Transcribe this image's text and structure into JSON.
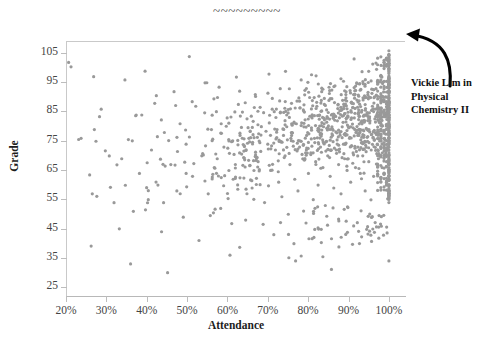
{
  "chart_data": {
    "type": "scatter",
    "title": "~~~~~~~~~",
    "xlabel": "Attendance",
    "ylabel": "Grade",
    "xlim": [
      20,
      104
    ],
    "ylim": [
      22,
      109
    ],
    "grid": false,
    "legend": null,
    "marker_color": "#999999",
    "marker_size_px": 3.2,
    "xticks": [
      20,
      30,
      40,
      50,
      60,
      70,
      80,
      90,
      100
    ],
    "xtick_labels": [
      "20%",
      "30%",
      "40%",
      "50%",
      "60%",
      "70%",
      "80%",
      "90%",
      "100%"
    ],
    "yticks": [
      25,
      35,
      45,
      55,
      65,
      75,
      85,
      95,
      105
    ],
    "ytick_labels": [
      "25",
      "35",
      "45",
      "55",
      "65",
      "75",
      "85",
      "95",
      "105"
    ],
    "annotations": [
      {
        "name": "vickie-lim-callout",
        "lines": [
          "Vickie Lim in",
          "Physical",
          "Chemistry II"
        ],
        "points_to": [
          100,
          106
        ]
      }
    ],
    "points": [
      [
        20.4,
        102
      ],
      [
        21.0,
        100.5
      ],
      [
        23.5,
        76
      ],
      [
        26.8,
        79
      ],
      [
        27.2,
        75
      ],
      [
        28.5,
        86
      ],
      [
        33.0,
        45
      ],
      [
        33.6,
        69
      ],
      [
        34.4,
        96
      ],
      [
        35.8,
        33
      ],
      [
        36.5,
        51
      ],
      [
        37.2,
        84
      ],
      [
        38.0,
        64
      ],
      [
        39.4,
        99
      ],
      [
        40.2,
        55
      ],
      [
        41.0,
        72
      ],
      [
        41.8,
        88
      ],
      [
        42.6,
        60
      ],
      [
        43.5,
        44
      ],
      [
        44.2,
        78
      ],
      [
        45.0,
        30
      ],
      [
        45.8,
        67
      ],
      [
        46.6,
        92
      ],
      [
        47.3,
        58
      ],
      [
        48.1,
        81
      ],
      [
        48.9,
        49
      ],
      [
        49.6,
        74
      ],
      [
        50.4,
        104
      ],
      [
        51.2,
        63
      ],
      [
        52.0,
        87
      ],
      [
        52.8,
        41
      ],
      [
        53.5,
        70
      ],
      [
        54.3,
        95
      ],
      [
        55.1,
        57
      ],
      [
        55.9,
        79
      ],
      [
        56.6,
        66
      ],
      [
        57.4,
        90
      ],
      [
        58.2,
        52
      ],
      [
        59.0,
        73
      ],
      [
        59.8,
        83
      ],
      [
        60.5,
        36
      ],
      [
        61.3,
        62
      ],
      [
        62.1,
        97
      ],
      [
        62.9,
        71
      ],
      [
        63.6,
        85
      ],
      [
        64.4,
        48
      ],
      [
        65.2,
        76
      ],
      [
        66.0,
        59
      ],
      [
        66.8,
        91
      ],
      [
        67.5,
        68
      ],
      [
        68.3,
        80
      ],
      [
        69.1,
        54
      ],
      [
        69.9,
        74
      ],
      [
        70.2,
        98
      ],
      [
        70.6,
        65
      ],
      [
        71.0,
        86
      ],
      [
        71.4,
        43
      ],
      [
        71.8,
        72
      ],
      [
        72.2,
        79
      ],
      [
        72.6,
        61
      ],
      [
        73.0,
        93
      ],
      [
        73.4,
        56
      ],
      [
        73.8,
        77
      ],
      [
        74.2,
        70
      ],
      [
        74.6,
        84
      ],
      [
        75.0,
        50
      ],
      [
        75.4,
        67
      ],
      [
        75.8,
        88
      ],
      [
        76.2,
        75
      ],
      [
        76.6,
        62
      ],
      [
        77.0,
        81
      ],
      [
        77.4,
        58
      ],
      [
        77.8,
        73
      ],
      [
        78.2,
        96
      ],
      [
        78.6,
        69
      ],
      [
        79.0,
        85
      ],
      [
        79.4,
        47
      ],
      [
        79.8,
        78
      ],
      [
        80.0,
        64
      ],
      [
        80.3,
        90
      ],
      [
        80.6,
        71
      ],
      [
        80.9,
        83
      ],
      [
        81.2,
        55
      ],
      [
        81.5,
        76
      ],
      [
        81.8,
        68
      ],
      [
        82.1,
        87
      ],
      [
        82.4,
        60
      ],
      [
        82.7,
        79
      ],
      [
        83.0,
        73
      ],
      [
        83.3,
        92
      ],
      [
        83.6,
        66
      ],
      [
        83.9,
        81
      ],
      [
        84.2,
        53
      ],
      [
        84.5,
        75
      ],
      [
        84.8,
        70
      ],
      [
        85.1,
        89
      ],
      [
        85.4,
        63
      ],
      [
        85.7,
        84
      ],
      [
        86.0,
        77
      ],
      [
        86.3,
        59
      ],
      [
        86.6,
        94
      ],
      [
        86.9,
        72
      ],
      [
        87.2,
        82
      ],
      [
        87.5,
        67
      ],
      [
        87.8,
        78
      ],
      [
        88.1,
        57
      ],
      [
        88.4,
        86
      ],
      [
        88.7,
        74
      ],
      [
        89.0,
        69
      ],
      [
        89.3,
        91
      ],
      [
        89.6,
        65
      ],
      [
        89.9,
        80
      ],
      [
        90.2,
        76
      ],
      [
        90.5,
        61
      ],
      [
        90.8,
        88
      ],
      [
        91.1,
        71
      ],
      [
        91.4,
        83
      ],
      [
        91.7,
        66
      ],
      [
        92.0,
        95
      ],
      [
        92.3,
        73
      ],
      [
        92.6,
        79
      ],
      [
        92.9,
        64
      ],
      [
        93.2,
        85
      ],
      [
        93.5,
        70
      ],
      [
        93.8,
        77
      ],
      [
        94.1,
        58
      ],
      [
        94.4,
        90
      ],
      [
        94.7,
        75
      ],
      [
        95.0,
        68
      ],
      [
        95.3,
        82
      ],
      [
        95.6,
        72
      ],
      [
        95.9,
        87
      ],
      [
        96.2,
        63
      ],
      [
        96.5,
        78
      ],
      [
        96.8,
        93
      ],
      [
        97.1,
        74
      ],
      [
        97.4,
        69
      ],
      [
        97.7,
        84
      ],
      [
        98.0,
        79
      ],
      [
        98.3,
        66
      ],
      [
        98.6,
        89
      ],
      [
        98.9,
        76
      ],
      [
        99.2,
        71
      ],
      [
        99.5,
        86
      ],
      [
        99.8,
        73
      ],
      [
        100.0,
        106
      ],
      [
        100.0,
        103
      ],
      [
        100.0,
        100
      ],
      [
        100.0,
        97
      ],
      [
        100.0,
        94
      ],
      [
        100.0,
        92
      ],
      [
        100.0,
        90
      ],
      [
        100.0,
        88
      ],
      [
        100.0,
        86
      ],
      [
        100.0,
        84
      ],
      [
        100.0,
        82
      ],
      [
        100.0,
        80
      ],
      [
        100.0,
        78
      ],
      [
        100.0,
        76
      ],
      [
        100.0,
        74
      ],
      [
        100.0,
        72
      ],
      [
        100.0,
        70
      ],
      [
        100.0,
        68
      ],
      [
        100.0,
        66
      ],
      [
        100.0,
        64
      ],
      [
        100.0,
        62
      ],
      [
        100.0,
        60
      ],
      [
        100.0,
        58
      ],
      [
        100.0,
        56
      ],
      [
        100.0,
        54
      ],
      [
        100.0,
        34
      ]
    ],
    "density_bands": [
      {
        "x_range": [
          62,
          100
        ],
        "y_range": [
          55,
          100
        ],
        "count": 560,
        "note": "dense cluster rising to the right"
      },
      {
        "x_range": [
          48,
          68
        ],
        "y_range": [
          40,
          100
        ],
        "count": 120,
        "note": "moderate mid scatter"
      },
      {
        "x_range": [
          20,
          50
        ],
        "y_range": [
          28,
          105
        ],
        "count": 40,
        "note": "sparse low-attendance scatter"
      },
      {
        "x_range": [
          60,
          100
        ],
        "y_range": [
          26,
          56
        ],
        "count": 70,
        "note": "sparse low-grade tail"
      }
    ]
  }
}
